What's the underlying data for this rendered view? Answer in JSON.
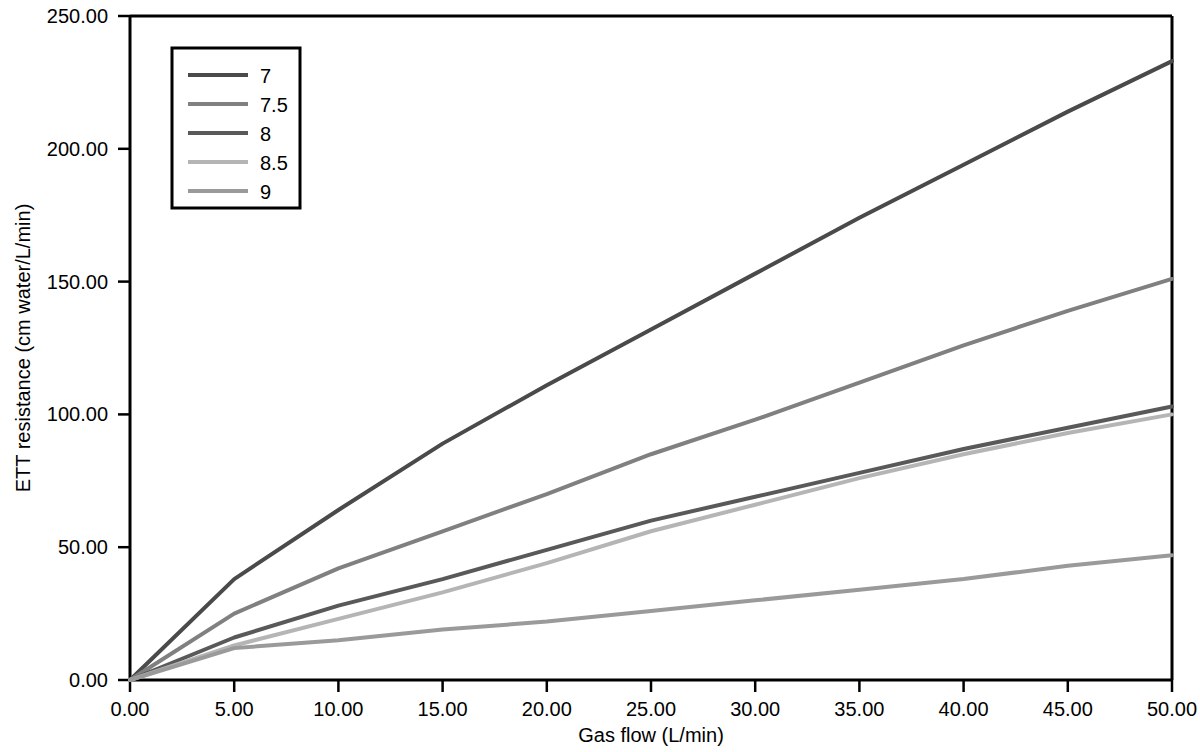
{
  "chart_data": {
    "type": "line",
    "title": "",
    "xlabel": "Gas flow (L/min)",
    "ylabel": "ETT resistance (cm water/L/min)",
    "xlim": [
      0,
      50
    ],
    "ylim": [
      0,
      250
    ],
    "grid": false,
    "legend_position": "top-left",
    "legend_title": "",
    "xticks": [
      0,
      5,
      10,
      15,
      20,
      25,
      30,
      35,
      40,
      45,
      50
    ],
    "xtick_labels": [
      "0.00",
      "5.00",
      "10.00",
      "15.00",
      "20.00",
      "25.00",
      "30.00",
      "35.00",
      "40.00",
      "45.00",
      "50.00"
    ],
    "yticks": [
      0,
      50,
      100,
      150,
      200,
      250
    ],
    "ytick_labels": [
      "0.00",
      "50.00",
      "100.00",
      "150.00",
      "200.00",
      "250.00"
    ],
    "x": [
      0,
      5,
      10,
      15,
      20,
      25,
      30,
      35,
      40,
      45,
      50
    ],
    "series": [
      {
        "name": "7",
        "color": "#4a4a4a",
        "width": 4,
        "values": [
          0,
          38,
          64,
          89,
          111,
          132,
          153,
          174,
          194,
          214,
          233
        ]
      },
      {
        "name": "7.5",
        "color": "#808080",
        "width": 4,
        "values": [
          0,
          25,
          42,
          56,
          70,
          85,
          98,
          112,
          126,
          139,
          151
        ]
      },
      {
        "name": "8",
        "color": "#595959",
        "width": 4,
        "values": [
          0,
          16,
          28,
          38,
          49,
          60,
          69,
          78,
          87,
          95,
          103
        ]
      },
      {
        "name": "8.5",
        "color": "#b5b5b5",
        "width": 4,
        "values": [
          0,
          13,
          23,
          33,
          44,
          56,
          66,
          76,
          85,
          93,
          100
        ]
      },
      {
        "name": "9",
        "color": "#9a9a9a",
        "width": 4,
        "values": [
          0,
          12,
          15,
          19,
          22,
          26,
          30,
          34,
          38,
          43,
          47
        ]
      }
    ]
  }
}
